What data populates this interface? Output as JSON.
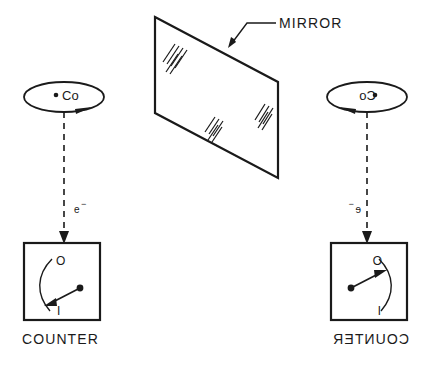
{
  "figure": {
    "background_color": "#ffffff",
    "ink_color": "#1a1a1a"
  },
  "mirror": {
    "label": "MIRROR",
    "shape": "parallelogram",
    "corners": "155,17 278,82 278,178 155,113",
    "hatch_groups": 3
  },
  "left_side": {
    "nucleus_label": "Co",
    "spin_arrow_direction": "clockwise-right",
    "particle_label": "e",
    "particle_charge": "−",
    "meter_top_label": "O",
    "meter_bottom_label": "I",
    "meter_caption": "COUNTER",
    "needle_direction": "down-left"
  },
  "right_side": {
    "nucleus_label": "Co",
    "nucleus_label_mirrored": "oC",
    "spin_arrow_direction": "counterclockwise-left",
    "particle_label": "e",
    "particle_charge": "−",
    "meter_top_label": "O",
    "meter_bottom_label": "I",
    "meter_caption": "COUNTER",
    "meter_caption_mirrored": "ЯETNUOC",
    "needle_direction": "up-right"
  }
}
